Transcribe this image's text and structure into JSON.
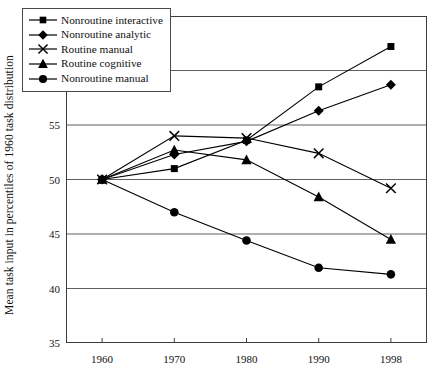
{
  "chart_data": {
    "type": "line",
    "title": "",
    "xlabel": "",
    "ylabel": "Mean task input in percentiles of 1960 task distribution",
    "categories": [
      "1960",
      "1970",
      "1980",
      "1990",
      "1998"
    ],
    "x_tick_labels": [
      "1960",
      "1970",
      "1980",
      "1990",
      "1998"
    ],
    "y_tick_labels": [
      "35",
      "40",
      "45",
      "50",
      "55",
      "60",
      "65"
    ],
    "y_ticks": [
      35,
      40,
      45,
      50,
      55,
      60,
      65
    ],
    "ylim": [
      35,
      65
    ],
    "grid": "horizontal",
    "legend_position": "top-left-inside",
    "series": [
      {
        "name": "Nonroutine interactive",
        "marker": "square",
        "color": "#000000",
        "values": [
          50.0,
          51.0,
          53.6,
          58.5,
          62.2
        ]
      },
      {
        "name": "Nonroutine analytic",
        "marker": "diamond",
        "color": "#000000",
        "values": [
          50.0,
          52.3,
          53.5,
          56.3,
          58.7
        ]
      },
      {
        "name": "Routine manual",
        "marker": "cross",
        "color": "#000000",
        "values": [
          50.0,
          54.0,
          53.8,
          52.4,
          49.2
        ]
      },
      {
        "name": "Routine cognitive",
        "marker": "triangle",
        "color": "#000000",
        "values": [
          50.0,
          52.7,
          51.8,
          48.4,
          44.5
        ]
      },
      {
        "name": "Nonroutine manual",
        "marker": "circle",
        "color": "#000000",
        "values": [
          50.0,
          47.0,
          44.4,
          41.9,
          41.3
        ]
      }
    ]
  },
  "axis": {
    "y_label": "Mean task input in percentiles of 1960 task distribution"
  }
}
